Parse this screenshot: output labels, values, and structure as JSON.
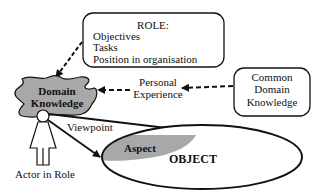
{
  "diagram": {
    "role_box": {
      "title": "ROLE:",
      "items": [
        "Objectives",
        "Tasks",
        "Position in organisation"
      ]
    },
    "domain_knowledge": {
      "line1": "Domain",
      "line2": "Knowledge",
      "fill": "#a8a8a8"
    },
    "personal_experience": {
      "line1": "Personal",
      "line2": "Experience"
    },
    "common_box": {
      "line1": "Common",
      "line2": "Domain",
      "line3": "Knowledge"
    },
    "viewpoint_label": "Viewpoint",
    "actor_label": "Actor in Role",
    "aspect": {
      "label": "Aspect",
      "fill": "#a8a8a8"
    },
    "object_label": "OBJECT"
  }
}
